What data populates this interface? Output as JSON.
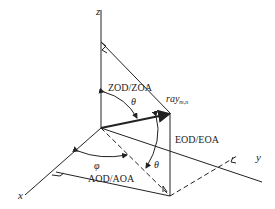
{
  "diagram": {
    "type": "3d-spherical-angle-coordinate-system",
    "axes": {
      "z_label": "z",
      "x_label": "x",
      "y_label": "y"
    },
    "ray": {
      "label_base": "ray",
      "label_sub": "m,n"
    },
    "angles": {
      "zenith_label": "ZOD/ZOA",
      "zenith_symbol": "θ",
      "elevation_label": "EOD/EOA",
      "elevation_symbol": "θ",
      "azimuth_label": "AOD/AOA",
      "azimuth_symbol": "φ"
    },
    "colors": {
      "line": "#222222",
      "background": "#ffffff"
    }
  }
}
